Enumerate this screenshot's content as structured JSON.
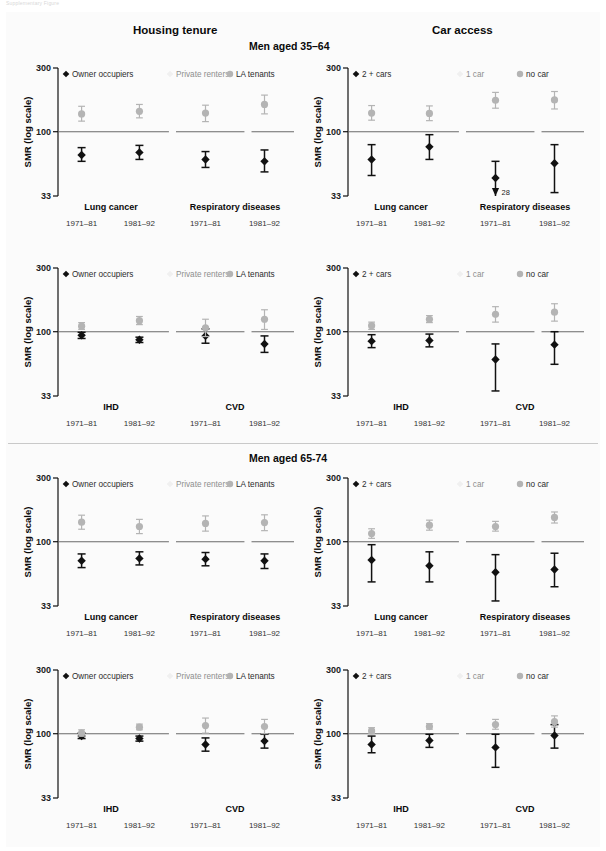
{
  "top_note": "Supplementary Figure",
  "headers": {
    "left_column": "Housing tenure",
    "right_column": "Car access",
    "age_group_1": "Men aged 35–64",
    "age_group_2": "Men aged 65-74"
  },
  "axis": {
    "y_label": "SMR (log scale)",
    "y_ticks": [
      "300",
      "100",
      "33"
    ],
    "y_tick_values": [
      300,
      100,
      33
    ],
    "y_min": 33,
    "y_max": 300,
    "reference_line": 100,
    "scale": "log"
  },
  "legends": {
    "tenure": [
      {
        "label": "Owner occupiers",
        "marker": "diamond",
        "color": "#111111"
      },
      {
        "label": "Private  renters",
        "marker": "diamond",
        "color": "#f0f0f0"
      },
      {
        "label": "LA tenants",
        "marker": "circle",
        "color": "#b4b4b4"
      }
    ],
    "car": [
      {
        "label": "2 + cars",
        "marker": "diamond",
        "color": "#111111"
      },
      {
        "label": "1 car",
        "marker": "diamond",
        "color": "#f0f0f0"
      },
      {
        "label": "no car",
        "marker": "circle",
        "color": "#b4b4b4"
      }
    ]
  },
  "period_labels": [
    "1971–81",
    "1981–92",
    "1971–81",
    "1981–92"
  ],
  "chart_data": [
    {
      "id": "p1",
      "type": "scatter",
      "title": "Housing tenure — Men aged 35–64 — Lung cancer / Respiratory diseases",
      "ylabel": "SMR (log scale)",
      "ylim": [
        33,
        300
      ],
      "log": true,
      "reference_line": 100,
      "groups": [
        "Lung cancer",
        "Respiratory diseases"
      ],
      "x": [
        "1971–81",
        "1981–92",
        "1971–81",
        "1981–92"
      ],
      "series": [
        {
          "name": "Owner occupiers",
          "color": "#111111",
          "marker": "diamond",
          "values": [
            67,
            70,
            62,
            60
          ],
          "lo": [
            60,
            62,
            54,
            50
          ],
          "hi": [
            76,
            79,
            71,
            73
          ]
        },
        {
          "name": "Private  renters",
          "color": "#f0f0f0",
          "marker": "diamond",
          "values": [
            null,
            null,
            null,
            null
          ],
          "lo": [
            null,
            null,
            null,
            null
          ],
          "hi": [
            null,
            null,
            null,
            null
          ]
        },
        {
          "name": "LA tenants",
          "color": "#b4b4b4",
          "marker": "circle",
          "values": [
            136,
            142,
            138,
            160
          ],
          "lo": [
            120,
            127,
            119,
            136
          ],
          "hi": [
            155,
            160,
            158,
            188
          ]
        }
      ]
    },
    {
      "id": "p2",
      "type": "scatter",
      "title": "Car access — Men aged 35–64 — Lung cancer / Respiratory diseases",
      "ylabel": "SMR (log scale)",
      "ylim": [
        33,
        300
      ],
      "log": true,
      "reference_line": 100,
      "groups": [
        "Lung cancer",
        "Respiratory diseases"
      ],
      "x": [
        "1971–81",
        "1981–92",
        "1971–81",
        "1981–92"
      ],
      "annotation": {
        "text": "28",
        "x_index": 2,
        "series": "2 + cars",
        "value": 28,
        "arrow": "down"
      },
      "series": [
        {
          "name": "2 + cars",
          "color": "#111111",
          "marker": "diamond",
          "values": [
            62,
            77,
            45,
            58
          ],
          "lo": [
            47,
            62,
            28,
            35
          ],
          "hi": [
            80,
            95,
            60,
            80
          ]
        },
        {
          "name": "1 car",
          "color": "#f0f0f0",
          "marker": "diamond",
          "values": [
            null,
            null,
            null,
            null
          ],
          "lo": [
            null,
            null,
            null,
            null
          ],
          "hi": [
            null,
            null,
            null,
            null
          ]
        },
        {
          "name": "no car",
          "color": "#b4b4b4",
          "marker": "circle",
          "values": [
            138,
            137,
            172,
            173
          ],
          "lo": [
            122,
            121,
            150,
            148
          ],
          "hi": [
            157,
            156,
            197,
            200
          ]
        }
      ]
    },
    {
      "id": "p3",
      "type": "scatter",
      "title": "Housing tenure — Men aged 35–64 — IHD / CVD",
      "ylabel": "SMR (log scale)",
      "ylim": [
        33,
        300
      ],
      "log": true,
      "reference_line": 100,
      "groups": [
        "IHD",
        "CVD"
      ],
      "x": [
        "1971–81",
        "1981–92",
        "1971–81",
        "1981–92"
      ],
      "series": [
        {
          "name": "Owner occupiers",
          "color": "#111111",
          "marker": "diamond",
          "values": [
            94,
            87,
            93,
            81
          ],
          "lo": [
            89,
            83,
            82,
            70
          ],
          "hi": [
            99,
            91,
            105,
            93
          ]
        },
        {
          "name": "Private  renters",
          "color": "#f0f0f0",
          "marker": "diamond",
          "values": [
            null,
            null,
            null,
            null
          ],
          "lo": [
            null,
            null,
            null,
            null
          ],
          "hi": [
            null,
            null,
            null,
            null
          ]
        },
        {
          "name": "LA tenants",
          "color": "#b4b4b4",
          "marker": "circle",
          "values": [
            110,
            121,
            107,
            124
          ],
          "lo": [
            104,
            113,
            92,
            104
          ],
          "hi": [
            117,
            130,
            124,
            146
          ]
        }
      ]
    },
    {
      "id": "p4",
      "type": "scatter",
      "title": "Car access — Men aged 35–64 — IHD / CVD",
      "ylabel": "SMR (log scale)",
      "ylim": [
        33,
        300
      ],
      "log": true,
      "reference_line": 100,
      "groups": [
        "IHD",
        "CVD"
      ],
      "x": [
        "1971–81",
        "1981–92",
        "1971–81",
        "1981–92"
      ],
      "series": [
        {
          "name": "2 + cars",
          "color": "#111111",
          "marker": "diamond",
          "values": [
            85,
            86,
            62,
            80
          ],
          "lo": [
            76,
            77,
            36,
            57
          ],
          "hi": [
            95,
            96,
            81,
            100
          ]
        },
        {
          "name": "1 car",
          "color": "#f0f0f0",
          "marker": "diamond",
          "values": [
            null,
            null,
            null,
            null
          ],
          "lo": [
            null,
            null,
            null,
            null
          ],
          "hi": [
            null,
            null,
            null,
            null
          ]
        },
        {
          "name": "no car",
          "color": "#b4b4b4",
          "marker": "circle",
          "values": [
            111,
            124,
            135,
            140
          ],
          "lo": [
            104,
            117,
            118,
            120
          ],
          "hi": [
            118,
            132,
            154,
            162
          ]
        }
      ]
    },
    {
      "id": "p5",
      "type": "scatter",
      "title": "Housing tenure — Men aged 65-74 — Lung cancer / Respiratory diseases",
      "ylabel": "SMR (log scale)",
      "ylim": [
        33,
        300
      ],
      "log": true,
      "reference_line": 100,
      "groups": [
        "Lung cancer",
        "Respiratory diseases"
      ],
      "x": [
        "1971–81",
        "1981–92",
        "1971–81",
        "1981–92"
      ],
      "series": [
        {
          "name": "Owner occupiers",
          "color": "#111111",
          "marker": "diamond",
          "values": [
            72,
            75,
            74,
            72
          ],
          "lo": [
            64,
            67,
            66,
            63
          ],
          "hi": [
            81,
            84,
            83,
            81
          ]
        },
        {
          "name": "Private  renters",
          "color": "#f0f0f0",
          "marker": "diamond",
          "values": [
            null,
            null,
            null,
            null
          ],
          "lo": [
            null,
            null,
            null,
            null
          ],
          "hi": [
            null,
            null,
            null,
            null
          ]
        },
        {
          "name": "LA tenants",
          "color": "#b4b4b4",
          "marker": "circle",
          "values": [
            140,
            130,
            137,
            139
          ],
          "lo": [
            124,
            115,
            120,
            121
          ],
          "hi": [
            158,
            147,
            156,
            159
          ]
        }
      ]
    },
    {
      "id": "p6",
      "type": "scatter",
      "title": "Car access — Men aged 65-74 — Lung cancer / Respiratory diseases",
      "ylabel": "SMR (log scale)",
      "ylim": [
        33,
        300
      ],
      "log": true,
      "reference_line": 100,
      "groups": [
        "Lung cancer",
        "Respiratory diseases"
      ],
      "x": [
        "1971–81",
        "1981–92",
        "1971–81",
        "1981–92"
      ],
      "series": [
        {
          "name": "2 + cars",
          "color": "#111111",
          "marker": "diamond",
          "values": [
            73,
            66,
            59,
            62
          ],
          "lo": [
            50,
            50,
            36,
            46
          ],
          "hi": [
            95,
            84,
            80,
            82
          ]
        },
        {
          "name": "1 car",
          "color": "#f0f0f0",
          "marker": "diamond",
          "values": [
            null,
            null,
            null,
            null
          ],
          "lo": [
            null,
            null,
            null,
            null
          ],
          "hi": [
            null,
            null,
            null,
            null
          ]
        },
        {
          "name": "no car",
          "color": "#b4b4b4",
          "marker": "circle",
          "values": [
            115,
            133,
            130,
            152
          ],
          "lo": [
            106,
            122,
            120,
            138
          ],
          "hi": [
            125,
            145,
            142,
            167
          ]
        }
      ]
    },
    {
      "id": "p7",
      "type": "scatter",
      "title": "Housing tenure — Men aged 65-74 — IHD / CVD",
      "ylabel": "SMR (log scale)",
      "ylim": [
        33,
        300
      ],
      "log": true,
      "reference_line": 100,
      "groups": [
        "IHD",
        "CVD"
      ],
      "x": [
        "1971–81",
        "1981–92",
        "1971–81",
        "1981–92"
      ],
      "series": [
        {
          "name": "Owner occupiers",
          "color": "#111111",
          "marker": "diamond",
          "values": [
            96,
            92,
            83,
            88
          ],
          "lo": [
            92,
            88,
            74,
            78
          ],
          "hi": [
            101,
            96,
            93,
            99
          ]
        },
        {
          "name": "Private  renters",
          "color": "#f0f0f0",
          "marker": "diamond",
          "values": [
            null,
            null,
            null,
            null
          ],
          "lo": [
            null,
            null,
            null,
            null
          ],
          "hi": [
            null,
            null,
            null,
            null
          ]
        },
        {
          "name": "LA tenants",
          "color": "#b4b4b4",
          "marker": "circle",
          "values": [
            101,
            112,
            115,
            113
          ],
          "lo": [
            96,
            107,
            101,
            100
          ],
          "hi": [
            107,
            118,
            131,
            128
          ]
        }
      ]
    },
    {
      "id": "p8",
      "type": "scatter",
      "title": "Car access — Men aged 65-74 — IHD / CVD",
      "ylabel": "SMR (log scale)",
      "ylim": [
        33,
        300
      ],
      "log": true,
      "reference_line": 100,
      "groups": [
        "IHD",
        "CVD"
      ],
      "x": [
        "1971–81",
        "1981–92",
        "1971–81",
        "1981–92"
      ],
      "series": [
        {
          "name": "2 + cars",
          "color": "#111111",
          "marker": "diamond",
          "values": [
            83,
            89,
            79,
            97
          ],
          "lo": [
            72,
            79,
            56,
            78
          ],
          "hi": [
            96,
            99,
            99,
            117
          ]
        },
        {
          "name": "1 car",
          "color": "#f0f0f0",
          "marker": "diamond",
          "values": [
            null,
            null,
            null,
            null
          ],
          "lo": [
            null,
            null,
            null,
            null
          ],
          "hi": [
            null,
            null,
            null,
            null
          ]
        },
        {
          "name": "no car",
          "color": "#b4b4b4",
          "marker": "circle",
          "values": [
            105,
            113,
            117,
            123
          ],
          "lo": [
            100,
            108,
            108,
            112
          ],
          "hi": [
            111,
            119,
            128,
            136
          ]
        }
      ]
    }
  ],
  "panel_layout": [
    {
      "id": "p1",
      "legend": "tenure",
      "left": 22,
      "top": 58
    },
    {
      "id": "p2",
      "legend": "car",
      "left": 312,
      "top": 58
    },
    {
      "id": "p3",
      "legend": "tenure",
      "left": 22,
      "top": 258
    },
    {
      "id": "p4",
      "legend": "car",
      "left": 312,
      "top": 258
    },
    {
      "id": "p5",
      "legend": "tenure",
      "left": 22,
      "top": 468
    },
    {
      "id": "p6",
      "legend": "car",
      "left": 312,
      "top": 468
    },
    {
      "id": "p7",
      "legend": "tenure",
      "left": 22,
      "top": 660
    },
    {
      "id": "p8",
      "legend": "car",
      "left": 312,
      "top": 660
    }
  ]
}
